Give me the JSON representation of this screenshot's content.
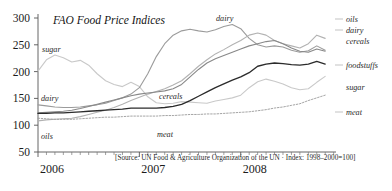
{
  "chart_data": {
    "type": "line",
    "title": "FAO Food Price Indices",
    "subtitle": "",
    "xlabel": "",
    "ylabel": "",
    "ylim": [
      50,
      300
    ],
    "xlim": [
      2006.0,
      2008.92
    ],
    "grid": false,
    "legend_position": "right-inline-labels",
    "source": "[Source: UN Food & Agriculture Organization of the UN · Index: 1998–2000=100]",
    "y_ticks": [
      50,
      100,
      150,
      200,
      250,
      300
    ],
    "x_ticks": [
      2006,
      2007,
      2008
    ],
    "x_tick_labels": [
      "2006",
      "2007",
      "2008"
    ],
    "x_minor_ticks_per_year": 12,
    "x": [
      2006.0,
      2006.083,
      2006.167,
      2006.25,
      2006.333,
      2006.417,
      2006.5,
      2006.583,
      2006.667,
      2006.75,
      2006.833,
      2006.917,
      2007.0,
      2007.083,
      2007.167,
      2007.25,
      2007.333,
      2007.417,
      2007.5,
      2007.583,
      2007.667,
      2007.75,
      2007.833,
      2007.917,
      2008.0,
      2008.083,
      2008.167,
      2008.25,
      2008.333,
      2008.417,
      2008.5,
      2008.583,
      2008.667,
      2008.75,
      2008.833
    ],
    "series": [
      {
        "name": "sugar",
        "color": "#c9c9c9",
        "width": 1.1,
        "dash": "none",
        "label_left": "sugar",
        "label_right": "sugar",
        "values": [
          201,
          222,
          231,
          226,
          218,
          221,
          212,
          196,
          183,
          176,
          172,
          180,
          172,
          153,
          142,
          140,
          141,
          144,
          143,
          142,
          141,
          145,
          148,
          151,
          156,
          170,
          181,
          186,
          182,
          177,
          170,
          166,
          168,
          180,
          191
        ]
      },
      {
        "name": "dairy",
        "color": "#9b9b9b",
        "width": 1.1,
        "dash": "none",
        "label_left": "dairy",
        "label_right": "dairy",
        "label_inline": "dairy",
        "values": [
          138,
          136,
          134,
          133,
          133,
          134,
          136,
          138,
          141,
          146,
          151,
          158,
          170,
          196,
          228,
          252,
          268,
          276,
          279,
          276,
          274,
          278,
          284,
          288,
          280,
          262,
          250,
          246,
          248,
          246,
          240,
          236,
          239,
          248,
          240
        ]
      },
      {
        "name": "oils",
        "color": "#b2b2b2",
        "width": 1.1,
        "dash": "none",
        "label_left": "oils",
        "label_right": "oils",
        "values": [
          108,
          110,
          111,
          112,
          113,
          116,
          120,
          124,
          128,
          133,
          139,
          146,
          152,
          158,
          163,
          168,
          175,
          183,
          196,
          210,
          222,
          233,
          241,
          250,
          258,
          268,
          272,
          268,
          258,
          252,
          248,
          244,
          252,
          268,
          262
        ]
      },
      {
        "name": "cereals",
        "color": "#888888",
        "width": 1.1,
        "dash": "none",
        "label_inline": "cereals",
        "label_right": "cereals",
        "values": [
          123,
          124,
          125,
          126,
          128,
          131,
          135,
          139,
          143,
          147,
          151,
          155,
          158,
          160,
          162,
          164,
          168,
          176,
          190,
          204,
          216,
          224,
          230,
          236,
          242,
          248,
          252,
          256,
          258,
          252,
          244,
          238,
          236,
          242,
          238
        ]
      },
      {
        "name": "foodstuffs",
        "color": "#2b2b2b",
        "width": 1.35,
        "dash": "none",
        "label_right": "foodstuffs",
        "values": [
          122,
          122,
          123,
          123,
          124,
          125,
          126,
          127,
          128,
          129,
          130,
          132,
          132,
          132,
          132,
          133,
          135,
          139,
          146,
          154,
          162,
          170,
          177,
          184,
          190,
          198,
          210,
          214,
          216,
          215,
          213,
          212,
          214,
          219,
          214
        ]
      },
      {
        "name": "meat",
        "color": "#9a9a9a",
        "width": 0.9,
        "dash": "1.6 1.6",
        "label_inline": "meat",
        "label_right": "meat",
        "values": [
          113,
          112,
          111,
          111,
          111,
          112,
          113,
          114,
          115,
          115,
          116,
          117,
          117,
          117,
          117,
          118,
          118,
          119,
          120,
          120,
          121,
          121,
          122,
          123,
          124,
          125,
          127,
          129,
          132,
          134,
          137,
          140,
          146,
          151,
          156
        ]
      }
    ],
    "inline_annotations": [
      {
        "text": "sugar",
        "x_px": 42,
        "y_px": 52
      },
      {
        "text": "dairy",
        "x_px": 41,
        "y_px": 101
      },
      {
        "text": "oils",
        "x_px": 41,
        "y_px": 139
      },
      {
        "text": "dairy",
        "x_px": 216,
        "y_px": 21
      },
      {
        "text": "cereals",
        "x_px": 159,
        "y_px": 99
      },
      {
        "text": "meat",
        "x_px": 157,
        "y_px": 137
      }
    ],
    "right_labels": [
      {
        "text": "oils",
        "y_px": 22
      },
      {
        "text": "dairy",
        "y_px": 33
      },
      {
        "text": "cereals",
        "y_px": 44
      },
      {
        "text": "foodstuffs",
        "y_px": 68
      },
      {
        "text": "sugar",
        "y_px": 90
      },
      {
        "text": "meat",
        "y_px": 115
      }
    ]
  }
}
